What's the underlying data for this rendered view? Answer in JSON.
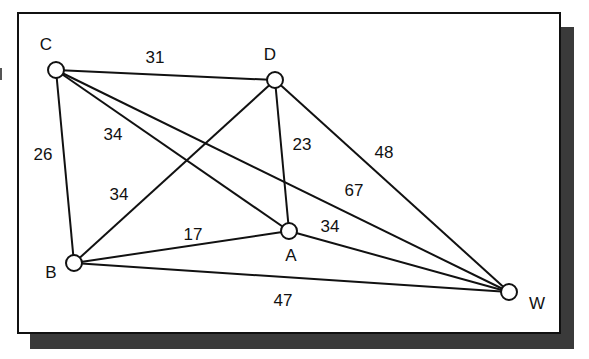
{
  "diagram": {
    "type": "weighted-graph",
    "nodes": [
      {
        "id": "C",
        "label": "C",
        "x": 56,
        "y": 70,
        "label_x": 46,
        "label_y": 50
      },
      {
        "id": "D",
        "label": "D",
        "x": 275,
        "y": 80,
        "label_x": 270,
        "label_y": 60
      },
      {
        "id": "A",
        "label": "A",
        "x": 289,
        "y": 231,
        "label_x": 291,
        "label_y": 261
      },
      {
        "id": "B",
        "label": "B",
        "x": 74,
        "y": 263,
        "label_x": 51,
        "label_y": 278
      },
      {
        "id": "W",
        "label": "W",
        "x": 509,
        "y": 292,
        "label_x": 537,
        "label_y": 309
      }
    ],
    "edges": [
      {
        "from": "C",
        "to": "D",
        "weight": "31",
        "label_x": 155,
        "label_y": 63
      },
      {
        "from": "C",
        "to": "B",
        "weight": "26",
        "label_x": 43,
        "label_y": 160
      },
      {
        "from": "C",
        "to": "A",
        "weight": "34",
        "label_x": 113,
        "label_y": 140
      },
      {
        "from": "C",
        "to": "W",
        "weight": "67",
        "label_x": 354,
        "label_y": 196
      },
      {
        "from": "D",
        "to": "B",
        "weight": "34",
        "label_x": 119,
        "label_y": 200
      },
      {
        "from": "D",
        "to": "A",
        "weight": "23",
        "label_x": 302,
        "label_y": 150
      },
      {
        "from": "D",
        "to": "W",
        "weight": "48",
        "label_x": 384,
        "label_y": 158
      },
      {
        "from": "B",
        "to": "A",
        "weight": "17",
        "label_x": 193,
        "label_y": 240
      },
      {
        "from": "A",
        "to": "W",
        "weight": "34",
        "label_x": 330,
        "label_y": 232
      },
      {
        "from": "B",
        "to": "W",
        "weight": "47",
        "label_x": 283,
        "label_y": 306
      }
    ],
    "node_radius": 8
  }
}
